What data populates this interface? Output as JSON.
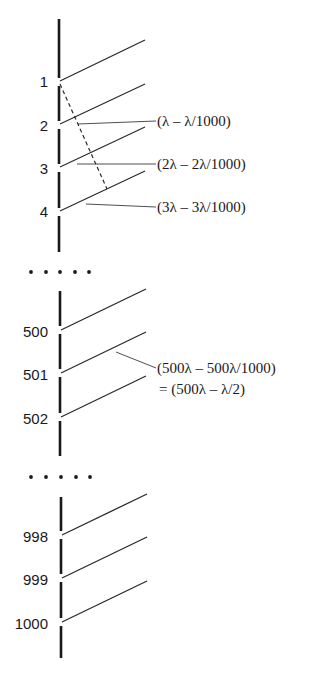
{
  "figure": {
    "axis_color": "#1a1a1a",
    "line_color": "#2a2a2a",
    "sections": [
      {
        "name": "top",
        "slits": [
          {
            "label": "1",
            "y": 81
          },
          {
            "label": "2",
            "y": 124
          },
          {
            "label": "3",
            "y": 167
          },
          {
            "label": "4",
            "y": 211
          }
        ]
      },
      {
        "name": "middle",
        "slits": [
          {
            "label": "500",
            "y": 330
          },
          {
            "label": "501",
            "y": 373
          },
          {
            "label": "502",
            "y": 417
          }
        ]
      },
      {
        "name": "bottom",
        "slits": [
          {
            "label": "998",
            "y": 535
          },
          {
            "label": "999",
            "y": 578
          },
          {
            "label": "1000",
            "y": 622
          }
        ]
      }
    ],
    "ellipsis": "• • • • •",
    "annotations": [
      {
        "text": "(λ – λ/1000)"
      },
      {
        "text": "(2λ – 2λ/1000)"
      },
      {
        "text": "(3λ – 3λ/1000)"
      },
      {
        "text": "(500λ – 500λ/1000)"
      },
      {
        "text": "= (500λ – λ/2)"
      }
    ]
  }
}
